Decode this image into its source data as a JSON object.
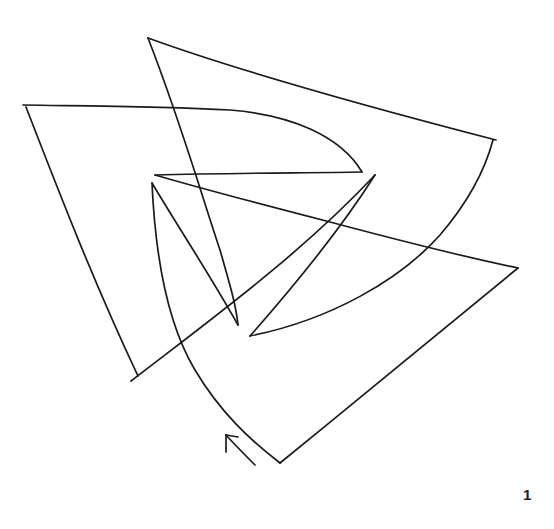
{
  "figure": {
    "type": "continuous-line drawing puzzle",
    "stroke_color": "#1a1a1a",
    "background_color": "#ffffff",
    "start_arrow": {
      "direction": "up-left",
      "position": [
        240,
        450
      ]
    },
    "vertices": [
      {
        "name": "bottom",
        "x": 280,
        "y": 463
      },
      {
        "name": "right",
        "x": 518,
        "y": 268
      },
      {
        "name": "inner-left-a",
        "x": 155,
        "y": 175
      },
      {
        "name": "inner-right-tip",
        "x": 362,
        "y": 172
      },
      {
        "name": "top-left",
        "x": 23,
        "y": 105
      },
      {
        "name": "bottom-left",
        "x": 133,
        "y": 378
      },
      {
        "name": "inner-right-tip-b",
        "x": 375,
        "y": 175
      },
      {
        "name": "inner-bottom-tip",
        "x": 250,
        "y": 336
      },
      {
        "name": "top-right",
        "x": 493,
        "y": 140
      },
      {
        "name": "top",
        "x": 148,
        "y": 38
      },
      {
        "name": "inner-bottom-tip-b",
        "x": 238,
        "y": 325
      },
      {
        "name": "inner-left-b",
        "x": 152,
        "y": 183
      }
    ]
  },
  "page_number": "1"
}
